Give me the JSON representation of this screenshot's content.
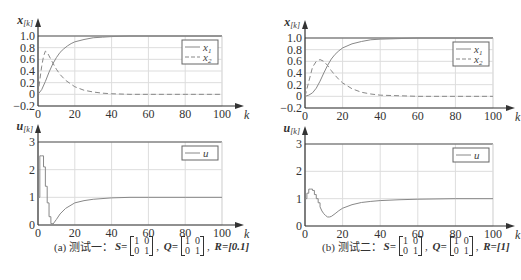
{
  "chart_data": [
    {
      "type": "line",
      "panel": "a-top",
      "ylabel": "x[k]",
      "xlabel": "k",
      "xlim": [
        0,
        100
      ],
      "ylim": [
        -0.2,
        1.0
      ],
      "xticks": [
        "0",
        "20",
        "40",
        "60",
        "80",
        "100"
      ],
      "yticks": [
        "-0.2",
        "0",
        "0.2",
        "0.4",
        "0.6",
        "0.8",
        "1.0"
      ],
      "grid": true,
      "legend_position": "upper right",
      "series": [
        {
          "name": "x1",
          "style": "solid",
          "x": [
            0,
            2,
            4,
            6,
            8,
            10,
            12,
            14,
            16,
            18,
            20,
            25,
            30,
            35,
            40,
            50,
            60,
            80,
            100
          ],
          "values": [
            0,
            0.08,
            0.22,
            0.38,
            0.52,
            0.63,
            0.72,
            0.78,
            0.83,
            0.87,
            0.9,
            0.94,
            0.97,
            0.98,
            0.99,
            1.0,
            1.0,
            1.0,
            1.0
          ]
        },
        {
          "name": "x2",
          "style": "dashed",
          "x": [
            0,
            1,
            2,
            3,
            4,
            5,
            6,
            8,
            10,
            12,
            15,
            20,
            25,
            30,
            35,
            40,
            50,
            60,
            80,
            100
          ],
          "values": [
            0,
            0.25,
            0.48,
            0.65,
            0.74,
            0.72,
            0.66,
            0.54,
            0.43,
            0.34,
            0.24,
            0.13,
            0.07,
            0.04,
            0.02,
            0.01,
            0,
            0,
            0,
            0
          ]
        }
      ]
    },
    {
      "type": "line",
      "panel": "a-bottom",
      "ylabel": "u[k]",
      "xlabel": "k",
      "xlim": [
        0,
        100
      ],
      "ylim": [
        0,
        3
      ],
      "xticks": [
        "0",
        "20",
        "40",
        "60",
        "80",
        "100"
      ],
      "yticks": [
        "0",
        "1",
        "2",
        "3"
      ],
      "grid": true,
      "legend_position": "upper right",
      "series": [
        {
          "name": "u",
          "style": "solid-step",
          "x": [
            0,
            1,
            2,
            3,
            4,
            5,
            6,
            7,
            8,
            10,
            12,
            15,
            20,
            25,
            30,
            40,
            50,
            60,
            80,
            100
          ],
          "values": [
            1.0,
            2.5,
            2.5,
            2.1,
            1.4,
            0.8,
            0.3,
            0.05,
            0.02,
            0.2,
            0.4,
            0.6,
            0.8,
            0.88,
            0.93,
            0.98,
            1.0,
            1.0,
            1.0,
            1.0
          ]
        }
      ]
    },
    {
      "type": "line",
      "panel": "b-top",
      "ylabel": "x[k]",
      "xlabel": "k",
      "xlim": [
        0,
        100
      ],
      "ylim": [
        -0.2,
        1.0
      ],
      "xticks": [
        "0",
        "20",
        "40",
        "60",
        "80",
        "100"
      ],
      "yticks": [
        "-0.2",
        "0",
        "0.2",
        "0.4",
        "0.6",
        "0.8",
        "1.0"
      ],
      "grid": true,
      "legend_position": "upper right",
      "series": [
        {
          "name": "x1",
          "style": "solid",
          "x": [
            0,
            2,
            4,
            6,
            8,
            10,
            12,
            14,
            16,
            18,
            20,
            25,
            30,
            35,
            40,
            50,
            60,
            80,
            100
          ],
          "values": [
            0,
            0.02,
            0.06,
            0.14,
            0.26,
            0.4,
            0.53,
            0.64,
            0.72,
            0.78,
            0.83,
            0.9,
            0.94,
            0.97,
            0.98,
            0.99,
            1.0,
            1.0,
            1.0
          ]
        },
        {
          "name": "x2",
          "style": "dashed",
          "x": [
            0,
            2,
            4,
            6,
            8,
            10,
            12,
            14,
            16,
            18,
            20,
            25,
            30,
            35,
            40,
            50,
            60,
            80,
            100
          ],
          "values": [
            0,
            0.25,
            0.5,
            0.6,
            0.63,
            0.6,
            0.53,
            0.44,
            0.36,
            0.29,
            0.23,
            0.13,
            0.07,
            0.04,
            0.02,
            0.01,
            0,
            0,
            0
          ]
        }
      ]
    },
    {
      "type": "line",
      "panel": "b-bottom",
      "ylabel": "u[k]",
      "xlabel": "k",
      "xlim": [
        0,
        100
      ],
      "ylim": [
        0,
        3
      ],
      "xticks": [
        "0",
        "20",
        "40",
        "60",
        "80",
        "100"
      ],
      "yticks": [
        "0",
        "1",
        "2",
        "3"
      ],
      "grid": true,
      "legend_position": "upper right",
      "series": [
        {
          "name": "u",
          "style": "solid-step",
          "x": [
            0,
            1,
            2,
            3,
            4,
            5,
            6,
            7,
            8,
            9,
            10,
            11,
            12,
            13,
            14,
            16,
            18,
            20,
            25,
            30,
            35,
            40,
            50,
            60,
            80,
            100
          ],
          "values": [
            1.0,
            1.2,
            1.35,
            1.35,
            1.3,
            1.15,
            1.0,
            0.85,
            0.7,
            0.55,
            0.45,
            0.38,
            0.33,
            0.33,
            0.35,
            0.45,
            0.56,
            0.65,
            0.78,
            0.86,
            0.9,
            0.93,
            0.96,
            0.98,
            1.0,
            1.0
          ]
        }
      ]
    }
  ],
  "captions": {
    "a": {
      "prefix": "(a) 测试一：",
      "S_label": "S=",
      "S": [
        [
          "1",
          "0"
        ],
        [
          "0",
          "1"
        ]
      ],
      "Q_label": "Q=",
      "Q": [
        [
          "1",
          "0"
        ],
        [
          "0",
          "1"
        ]
      ],
      "R_text": "R=[0.1]"
    },
    "b": {
      "prefix": "(b) 测试二：",
      "S_label": "S=",
      "S": [
        [
          "1",
          "0"
        ],
        [
          "0",
          "1"
        ]
      ],
      "Q_label": "Q=",
      "Q": [
        [
          "1",
          "0"
        ],
        [
          "0",
          "1"
        ]
      ],
      "R_text": "R=[1]"
    }
  },
  "colors": {
    "line": "#888888",
    "grid": "#dddddd",
    "axis": "#333333",
    "frame": "#555555"
  }
}
